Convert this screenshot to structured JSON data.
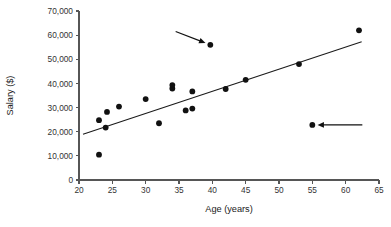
{
  "chart_data": {
    "type": "scatter",
    "title": "",
    "xlabel": "Age (years)",
    "ylabel": "Salary ($)",
    "xlim": [
      20,
      65
    ],
    "ylim": [
      0,
      70000
    ],
    "xticks": [
      20,
      25,
      30,
      35,
      40,
      45,
      50,
      55,
      60,
      65
    ],
    "xtick_labels": [
      "20",
      "25",
      "30",
      "35",
      "40",
      "45",
      "50",
      "55",
      "60",
      "65"
    ],
    "yticks": [
      0,
      10000,
      20000,
      30000,
      40000,
      50000,
      60000,
      70000
    ],
    "ytick_labels": [
      "0",
      "10,000",
      "20,000",
      "30,000",
      "40,000",
      "50,000",
      "60,000",
      "70,000"
    ],
    "grid": false,
    "legend": false,
    "marker_color": "#111111",
    "points": [
      {
        "x": 23.0,
        "y": 10500
      },
      {
        "x": 23.0,
        "y": 24800
      },
      {
        "x": 24.0,
        "y": 21700
      },
      {
        "x": 24.2,
        "y": 28200
      },
      {
        "x": 26.0,
        "y": 30400
      },
      {
        "x": 30.0,
        "y": 33500
      },
      {
        "x": 32.0,
        "y": 23500
      },
      {
        "x": 34.0,
        "y": 37900
      },
      {
        "x": 34.0,
        "y": 39300
      },
      {
        "x": 36.0,
        "y": 28800
      },
      {
        "x": 37.0,
        "y": 29600
      },
      {
        "x": 37.0,
        "y": 36700
      },
      {
        "x": 39.7,
        "y": 56000
      },
      {
        "x": 42.0,
        "y": 37700
      },
      {
        "x": 45.0,
        "y": 41500
      },
      {
        "x": 53.0,
        "y": 48000
      },
      {
        "x": 55.0,
        "y": 22800
      },
      {
        "x": 62.0,
        "y": 62000
      }
    ],
    "trend_line": {
      "x": [
        20.6,
        62.4
      ],
      "y": [
        19000,
        57300
      ],
      "color": "#1a1a1a"
    },
    "annotations": [
      {
        "name": "upper-outlier-arrow",
        "target_x": 39.7,
        "target_y": 56000,
        "tail_x": 34.5,
        "tail_y": 61500
      },
      {
        "name": "lower-outlier-arrow",
        "target_x": 55.0,
        "target_y": 22800,
        "tail_x": 62.5,
        "tail_y": 22800
      }
    ]
  }
}
